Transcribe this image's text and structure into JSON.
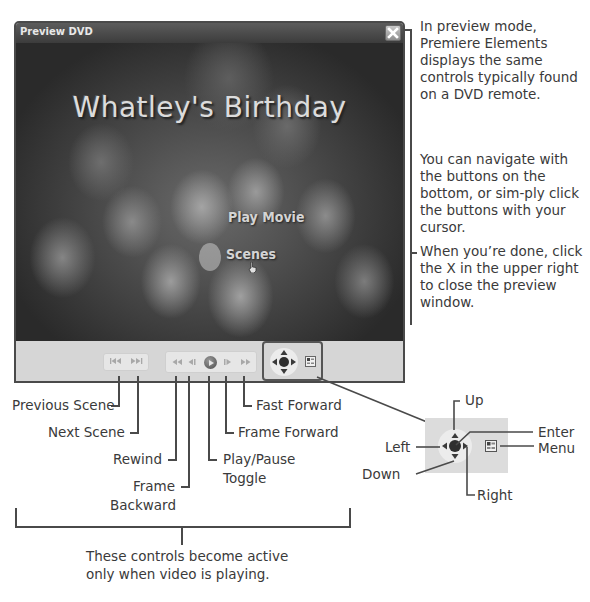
{
  "window": {
    "title": "Preview DVD",
    "close_icon": "close-x-icon"
  },
  "dvd_menu": {
    "title": "Whatley's Birthday",
    "items": [
      {
        "label": "Play Movie"
      },
      {
        "label": "Scenes"
      }
    ],
    "cursor": "hand-pointer-icon"
  },
  "controls": {
    "scene_group": [
      {
        "name": "previous-scene",
        "glyph": "⏮",
        "icon": "previous-scene-icon"
      },
      {
        "name": "next-scene",
        "glyph": "⏭",
        "icon": "next-scene-icon"
      }
    ],
    "playback_group": [
      {
        "name": "rewind",
        "glyph": "◀◀",
        "icon": "rewind-icon"
      },
      {
        "name": "frame-backward",
        "glyph": "◀❙",
        "icon": "frame-backward-icon"
      },
      {
        "name": "play-pause",
        "glyph": "▶",
        "icon": "play-pause-icon"
      },
      {
        "name": "frame-forward",
        "glyph": "❙▶",
        "icon": "frame-forward-icon"
      },
      {
        "name": "fast-forward",
        "glyph": "▶▶",
        "icon": "fast-forward-icon"
      }
    ],
    "nav_group": {
      "dpad": "dpad-icon",
      "menu": "menu-icon"
    }
  },
  "annotations": {
    "right_notes": [
      "In preview mode, Premiere Elements displays the same controls typically found on a DVD remote.",
      "You can navigate with the buttons on the bottom, or sim-ply click the buttons with your cursor.",
      "When you’re done, click the X in the upper right to close the preview window."
    ],
    "labels": {
      "previous_scene": "Previous Scene",
      "next_scene": "Next Scene",
      "rewind": "Rewind",
      "frame_backward_1": "Frame",
      "frame_backward_2": "Backward",
      "play_pause_1": "Play/Pause",
      "play_pause_2": "Toggle",
      "frame_forward": "Frame Forward",
      "fast_forward": "Fast Forward",
      "up": "Up",
      "enter": "Enter",
      "left": "Left",
      "menu": "Menu",
      "down": "Down",
      "right": "Right"
    },
    "bracket_note_1": "These controls become active",
    "bracket_note_2": "only when video is playing."
  }
}
